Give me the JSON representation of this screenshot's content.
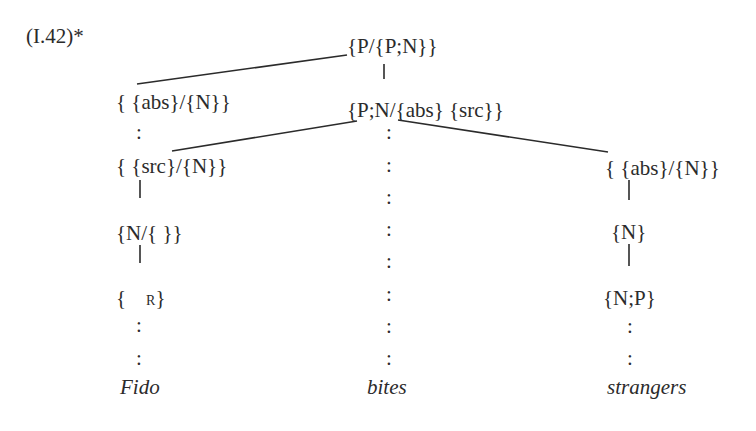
{
  "example_label": "(I.42)*",
  "nodes": {
    "root": "{P/{P;N}}",
    "verb": "{P;N/{abs} {src}}",
    "left_1": "{ {abs}/{N}}",
    "left_2": "{ {src}/{N}}",
    "left_3": "{N/{ }}",
    "left_4_open": "{",
    "left_4_sub": "R",
    "left_4_close": "}",
    "right_1": "{ {abs}/{N}}",
    "right_2": "{N}",
    "right_3": "{N;P}"
  },
  "words": {
    "left": "Fido",
    "middle": "bites",
    "right": "strangers"
  },
  "dot": ":",
  "colors": {
    "ink": "#2b2b2b",
    "background": "#ffffff"
  }
}
